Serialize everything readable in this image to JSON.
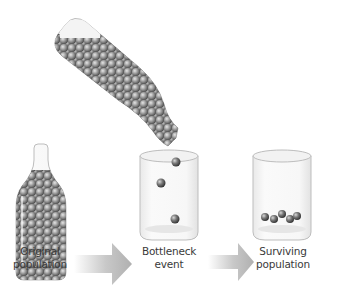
{
  "diagram": {
    "stages": [
      {
        "id": "original",
        "label_line1": "Original",
        "label_line2": "population",
        "container": "bottle",
        "ball_count": 60
      },
      {
        "id": "bottleneck",
        "label_line1": "Bottleneck",
        "label_line2": "event",
        "container": "glass",
        "ball_count": 3
      },
      {
        "id": "surviving",
        "label_line1": "Surviving",
        "label_line2": "population",
        "container": "glass",
        "ball_count": 5
      }
    ],
    "arrows": [
      {
        "from": "original",
        "to": "bottleneck",
        "icon": "right-arrow-icon"
      },
      {
        "from": "bottleneck",
        "to": "surviving",
        "icon": "right-arrow-icon"
      }
    ],
    "pouring_bottle": {
      "icon": "tilted-bottle-icon",
      "ball_count": 60
    },
    "colors": {
      "label_text": "#3a3a3a",
      "arrow_fill": "#b8b8b8",
      "ball_dark": "#4a4a4a",
      "ball_light": "#a8a8a8",
      "glass_outline": "#bcbcbc"
    }
  }
}
